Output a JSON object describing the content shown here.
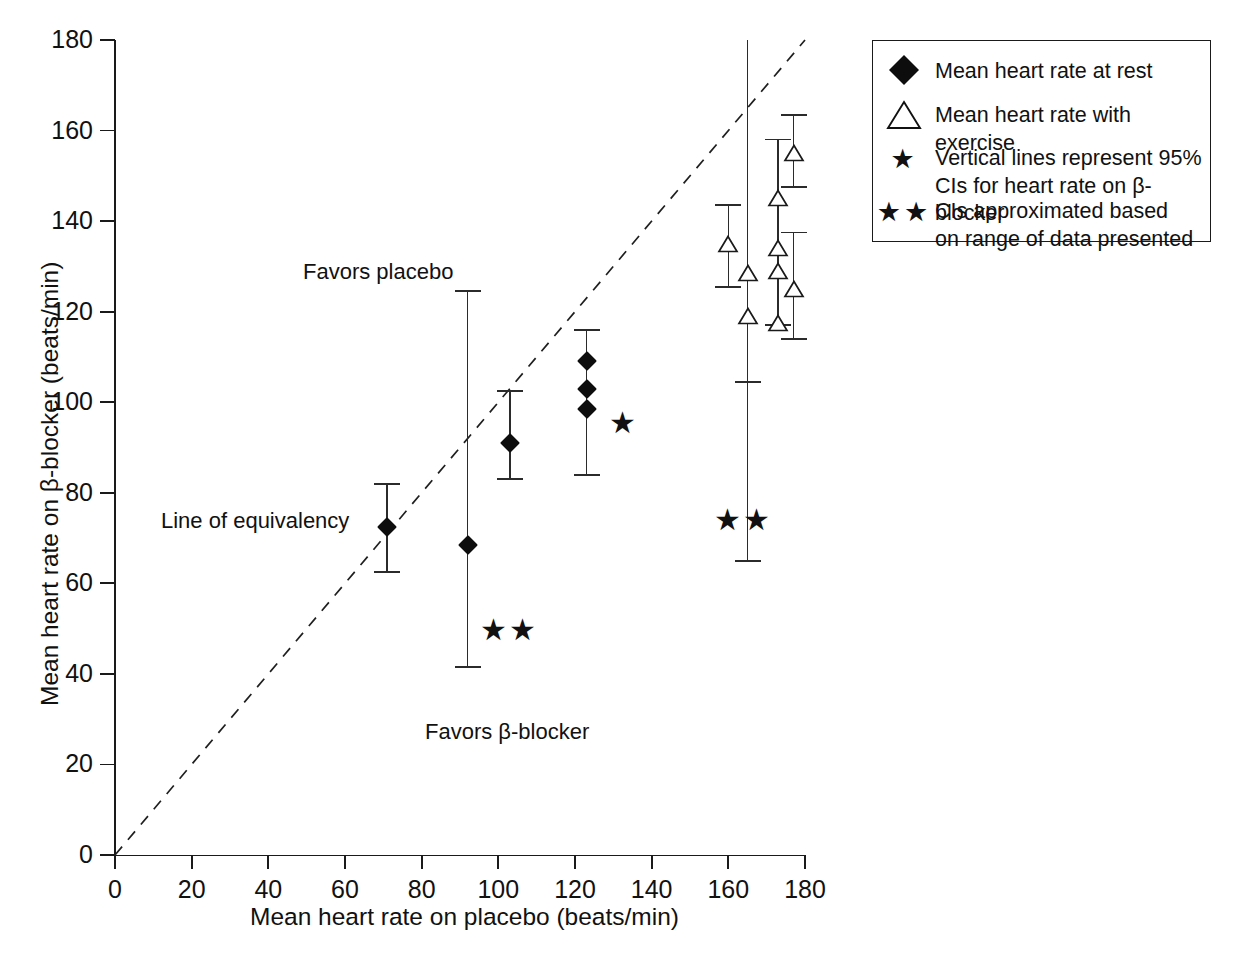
{
  "chart_data": {
    "type": "scatter",
    "title": "",
    "xlabel": "Mean heart rate on placebo (beats/min)",
    "ylabel": "Mean heart rate on β-blocker (beats/min)",
    "xlim": [
      0,
      180
    ],
    "ylim": [
      0,
      180
    ],
    "xticks": [
      0,
      20,
      40,
      60,
      80,
      100,
      120,
      140,
      160,
      180
    ],
    "yticks": [
      0,
      20,
      40,
      60,
      80,
      100,
      120,
      140,
      160,
      180
    ],
    "xtick_labels": [
      "0",
      "20",
      "40",
      "60",
      "80",
      "100",
      "120",
      "140",
      "160",
      "180"
    ],
    "ytick_labels": [
      "0",
      "20",
      "40",
      "60",
      "80",
      "100",
      "120",
      "140",
      "160",
      "180"
    ],
    "grid": false,
    "legend_position": "top-right",
    "reference_line": {
      "name": "Line of equivalency",
      "style": "dashed",
      "from": [
        0,
        0
      ],
      "to": [
        180,
        180
      ]
    },
    "series": [
      {
        "name": "Mean heart rate at rest",
        "marker": "filled-diamond",
        "points": [
          {
            "x": 71,
            "y": 72.5,
            "ci_low": 62.5,
            "ci_high": 82.0
          },
          {
            "x": 92,
            "y": 68.5,
            "ci_low": 41.5,
            "ci_high": 124.5
          },
          {
            "x": 103,
            "y": 91.0,
            "ci_low": 83.0,
            "ci_high": 102.5
          },
          {
            "x": 123,
            "y": 109.0,
            "ci_low": 84.0,
            "ci_high": 116.0
          },
          {
            "x": 123,
            "y": 103.0,
            "ci_low": 84.0,
            "ci_high": 116.0
          },
          {
            "x": 123,
            "y": 98.5,
            "ci_low": 84.0,
            "ci_high": 116.0
          }
        ]
      },
      {
        "name": "Mean heart rate with exercise",
        "marker": "open-triangle",
        "points": [
          {
            "x": 160,
            "y": 135.0,
            "ci_low": 125.5,
            "ci_high": 143.5
          },
          {
            "x": 165,
            "y": 128.5,
            "ci_low": 65.0,
            "ci_high": 180.0
          },
          {
            "x": 165,
            "y": 119.0,
            "ci_low": 104.5,
            "ci_high": 180.0
          },
          {
            "x": 173,
            "y": 145.0,
            "ci_low": 117.0,
            "ci_high": 158.0
          },
          {
            "x": 173,
            "y": 134.0,
            "ci_low": 117.0,
            "ci_high": 158.0
          },
          {
            "x": 173,
            "y": 129.0,
            "ci_low": 117.0,
            "ci_high": 158.0
          },
          {
            "x": 173,
            "y": 117.5,
            "ci_low": 117.0,
            "ci_high": 158.0
          },
          {
            "x": 177,
            "y": 155.0,
            "ci_low": 147.5,
            "ci_high": 163.5
          },
          {
            "x": 177,
            "y": 125.0,
            "ci_low": 114.0,
            "ci_high": 137.5
          }
        ]
      }
    ],
    "annotations": [
      {
        "id": "favors-placebo",
        "text": "Favors placebo",
        "x": 78,
        "y": 128
      },
      {
        "id": "favors-bblocker",
        "text": "Favors β-blocker",
        "x": 122,
        "y": 27
      },
      {
        "id": "line-of-equivalency",
        "text": "Line of equivalency",
        "x": 37,
        "y": 74
      },
      {
        "id": "star-single",
        "text": "★",
        "x": 131,
        "y": 95.5
      },
      {
        "id": "star-double-left",
        "text": "★★",
        "x": 98,
        "y": 51
      },
      {
        "id": "star-double-right",
        "text": "★★",
        "x": 160,
        "y": 75.5
      }
    ]
  },
  "axes": {
    "x_title": "Mean heart rate on placebo (beats/min)",
    "y_title": "Mean heart rate on β-blocker (beats/min)",
    "x_labels": [
      "0",
      "20",
      "40",
      "60",
      "80",
      "100",
      "120",
      "140",
      "160",
      "180"
    ],
    "y_labels": [
      "0",
      "20",
      "40",
      "60",
      "80",
      "100",
      "120",
      "140",
      "160",
      "180"
    ]
  },
  "plot_notes": {
    "favors_placebo": "Favors placebo",
    "favors_bblocker": "Favors β-blocker",
    "line_of_equivalency": "Line of equivalency",
    "star_single": "★",
    "star_double_left": "★★",
    "star_double_right": "★★"
  },
  "legend": {
    "rows": [
      {
        "symbol": "filled-diamond",
        "label": "Mean heart rate at rest"
      },
      {
        "symbol": "open-triangle",
        "label": "Mean heart rate with exercise"
      },
      {
        "symbol": "★",
        "label": "Vertical lines represent 95%\nCIs for heart rate on  β-blocker"
      },
      {
        "symbol": "★★",
        "label": "CIs approximated based\non range of data presented"
      }
    ]
  },
  "colors": {
    "axis": "#1a1a1a",
    "marker": "#0d0d0d",
    "errorbar": "#2b2b2b",
    "background": "#ffffff",
    "text": "#111111"
  },
  "bottom_caption": ""
}
